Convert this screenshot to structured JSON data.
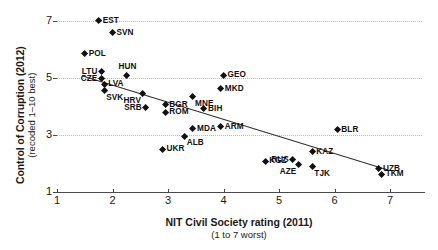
{
  "chart_data": {
    "type": "scatter",
    "title": "",
    "xlabel": "NIT Civil Society rating (2011)",
    "xlabel_sub": "(1 to 7 worst)",
    "ylabel": "Control of Corruption (2012)",
    "ylabel_sub": "(recoded 1–10 best)",
    "xlim": [
      1,
      7.6
    ],
    "ylim": [
      1,
      7.4
    ],
    "xticks": [
      1,
      2,
      3,
      4,
      5,
      6,
      7
    ],
    "xtick_labels": [
      "1",
      "2",
      "3",
      "4",
      "5",
      "6",
      "7"
    ],
    "yticks": [
      1,
      3,
      5,
      7
    ],
    "ytick_labels": [
      "1",
      "3",
      "5",
      "7"
    ],
    "grid": "horizontal-dotted",
    "legend": "none",
    "marker": "diamond",
    "marker_color": "#111111",
    "trendline": {
      "type": "linear-fit",
      "color": "#333333",
      "x_start": 1.45,
      "y_start": 5.08,
      "x_end": 6.95,
      "y_end": 1.78
    },
    "points": [
      {
        "label": "EST",
        "x": 1.75,
        "y": 7.0,
        "label_pos": "right"
      },
      {
        "label": "SVN",
        "x": 2.0,
        "y": 6.58,
        "label_pos": "right"
      },
      {
        "label": "POL",
        "x": 1.5,
        "y": 5.85,
        "label_pos": "right"
      },
      {
        "label": "LTU",
        "x": 1.8,
        "y": 5.22,
        "label_pos": "left"
      },
      {
        "label": "HUN",
        "x": 2.25,
        "y": 5.1,
        "label_pos": "top"
      },
      {
        "label": "CZE",
        "x": 1.8,
        "y": 4.98,
        "label_pos": "left"
      },
      {
        "label": "LVA",
        "x": 1.85,
        "y": 4.78,
        "label_pos": "right"
      },
      {
        "label": "SVK",
        "x": 1.85,
        "y": 4.55,
        "label_pos": "bottom-right"
      },
      {
        "label": "HRV",
        "x": 2.55,
        "y": 4.45,
        "label_pos": "bottom-left"
      },
      {
        "label": "SRB",
        "x": 2.6,
        "y": 3.95,
        "label_pos": "left"
      },
      {
        "label": "BGR",
        "x": 2.95,
        "y": 4.05,
        "label_pos": "right"
      },
      {
        "label": "ROM",
        "x": 2.95,
        "y": 3.8,
        "label_pos": "right"
      },
      {
        "label": "MNE",
        "x": 3.45,
        "y": 4.35,
        "label_pos": "bottom-right"
      },
      {
        "label": "MKD",
        "x": 3.95,
        "y": 4.62,
        "label_pos": "right"
      },
      {
        "label": "GEO",
        "x": 4.0,
        "y": 5.1,
        "label_pos": "right"
      },
      {
        "label": "BIH",
        "x": 3.65,
        "y": 3.92,
        "label_pos": "right"
      },
      {
        "label": "MDA",
        "x": 3.45,
        "y": 3.22,
        "label_pos": "right"
      },
      {
        "label": "ARM",
        "x": 3.95,
        "y": 3.28,
        "label_pos": "right"
      },
      {
        "label": "ALB",
        "x": 3.3,
        "y": 2.95,
        "label_pos": "bottom-right"
      },
      {
        "label": "UKR",
        "x": 2.9,
        "y": 2.5,
        "label_pos": "right"
      },
      {
        "label": "BLR",
        "x": 6.05,
        "y": 3.18,
        "label_pos": "right"
      },
      {
        "label": "KAZ",
        "x": 5.6,
        "y": 2.42,
        "label_pos": "right"
      },
      {
        "label": "RUS",
        "x": 5.25,
        "y": 2.12,
        "label_pos": "left"
      },
      {
        "label": "KGZ",
        "x": 4.75,
        "y": 2.08,
        "label_pos": "right"
      },
      {
        "label": "AZE",
        "x": 5.35,
        "y": 1.95,
        "label_pos": "bottom-left"
      },
      {
        "label": "TJK",
        "x": 5.6,
        "y": 1.88,
        "label_pos": "bottom-right"
      },
      {
        "label": "UZB",
        "x": 6.8,
        "y": 1.82,
        "label_pos": "right"
      },
      {
        "label": "TKM",
        "x": 6.85,
        "y": 1.62,
        "label_pos": "right"
      }
    ]
  }
}
